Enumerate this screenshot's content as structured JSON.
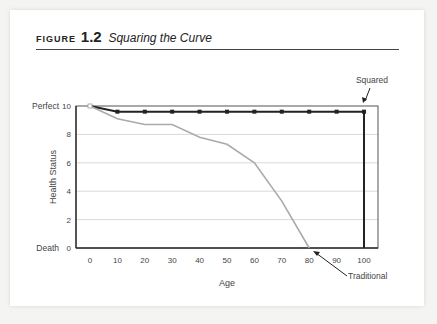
{
  "figure": {
    "label": "FIGURE",
    "number": "1.2",
    "caption": "Squaring the Curve"
  },
  "chart_data": {
    "type": "line",
    "title": "Squaring the Curve",
    "xlabel": "Age",
    "ylabel": "Health Status",
    "x": [
      0,
      10,
      20,
      30,
      40,
      50,
      60,
      70,
      80,
      90,
      100
    ],
    "xticks": [
      "0",
      "10",
      "20",
      "30",
      "40",
      "50",
      "60",
      "70",
      "80",
      "90",
      "100"
    ],
    "yticks": [
      "0",
      "2",
      "4",
      "6",
      "8",
      "10"
    ],
    "ytick_prefix": {
      "10": "Perfect",
      "0": "Death"
    },
    "xlim": [
      0,
      100
    ],
    "ylim": [
      0,
      10
    ],
    "grid": "horizontal",
    "series": [
      {
        "name": "Squared",
        "color": "#222222",
        "x": [
          0,
          10,
          20,
          30,
          40,
          50,
          60,
          70,
          80,
          90,
          100,
          100
        ],
        "values": [
          10,
          9.6,
          9.6,
          9.6,
          9.6,
          9.6,
          9.6,
          9.6,
          9.6,
          9.6,
          9.6,
          0
        ]
      },
      {
        "name": "Traditional",
        "color": "#aaaaaa",
        "x": [
          0,
          10,
          20,
          30,
          40,
          50,
          60,
          70,
          80
        ],
        "values": [
          10,
          9.1,
          8.7,
          8.7,
          7.8,
          7.3,
          6.0,
          3.3,
          0
        ]
      }
    ],
    "annotations": [
      "Squared",
      "Traditional"
    ]
  }
}
